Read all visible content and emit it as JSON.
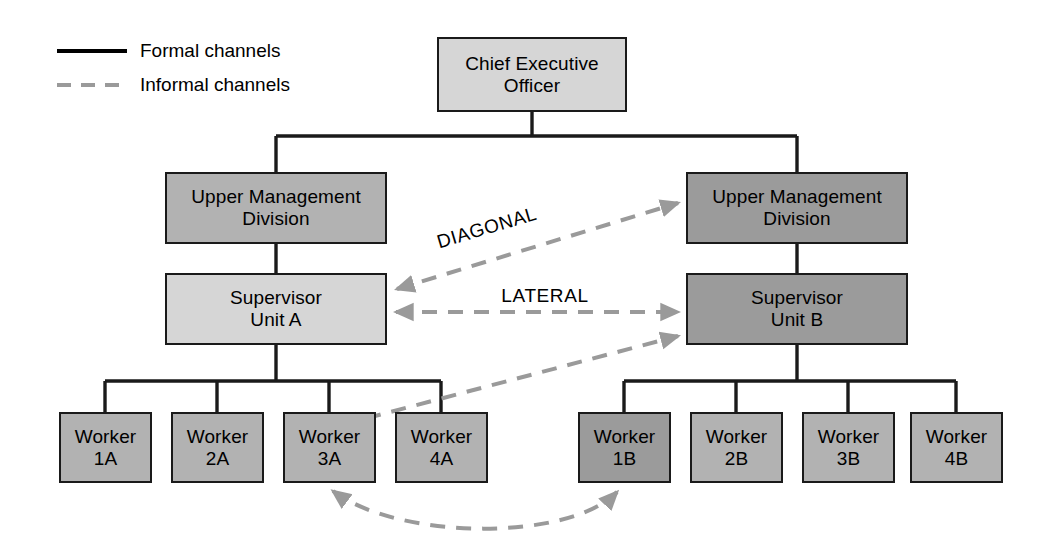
{
  "legend": {
    "formal": {
      "label": "Formal channels",
      "line_style": "solid",
      "color": "#000000"
    },
    "informal": {
      "label": "Informal channels",
      "line_style": "dashed",
      "color": "#9a9a9a"
    }
  },
  "flow_labels": {
    "diagonal": "DIAGONAL",
    "lateral": "LATERAL"
  },
  "chart_data": {
    "type": "diagram",
    "title": "",
    "nodes": [
      {
        "id": "ceo",
        "label": "Chief Executive\nOfficer",
        "tone": "light",
        "x": 437,
        "y": 37,
        "w": 190,
        "h": 75
      },
      {
        "id": "um_a",
        "label": "Upper Management\nDivision",
        "tone": "mid",
        "x": 165,
        "y": 172,
        "w": 222,
        "h": 72
      },
      {
        "id": "um_b",
        "label": "Upper Management\nDivision",
        "tone": "dark",
        "x": 686,
        "y": 172,
        "w": 222,
        "h": 72
      },
      {
        "id": "sup_a",
        "label": "Supervisor\nUnit A",
        "tone": "light",
        "x": 165,
        "y": 273,
        "w": 222,
        "h": 72
      },
      {
        "id": "sup_b",
        "label": "Supervisor\nUnit B",
        "tone": "dark",
        "x": 686,
        "y": 273,
        "w": 222,
        "h": 72
      },
      {
        "id": "w1a",
        "label": "Worker\n1A",
        "tone": "mid",
        "x": 59,
        "y": 412,
        "w": 93,
        "h": 71
      },
      {
        "id": "w2a",
        "label": "Worker\n2A",
        "tone": "mid",
        "x": 171,
        "y": 412,
        "w": 93,
        "h": 71
      },
      {
        "id": "w3a",
        "label": "Worker\n3A",
        "tone": "mid",
        "x": 283,
        "y": 412,
        "w": 93,
        "h": 71
      },
      {
        "id": "w4a",
        "label": "Worker\n4A",
        "tone": "mid",
        "x": 395,
        "y": 412,
        "w": 93,
        "h": 71
      },
      {
        "id": "w1b",
        "label": "Worker\n1B",
        "tone": "dark",
        "x": 578,
        "y": 412,
        "w": 93,
        "h": 71
      },
      {
        "id": "w2b",
        "label": "Worker\n2B",
        "tone": "mid",
        "x": 690,
        "y": 412,
        "w": 93,
        "h": 71
      },
      {
        "id": "w3b",
        "label": "Worker\n3B",
        "tone": "mid",
        "x": 802,
        "y": 412,
        "w": 93,
        "h": 71
      },
      {
        "id": "w4b",
        "label": "Worker\n4B",
        "tone": "mid",
        "x": 910,
        "y": 412,
        "w": 93,
        "h": 71
      }
    ],
    "formal_edges": [
      {
        "from": "ceo",
        "to": "um_a"
      },
      {
        "from": "ceo",
        "to": "um_b"
      },
      {
        "from": "um_a",
        "to": "sup_a"
      },
      {
        "from": "um_b",
        "to": "sup_b"
      },
      {
        "from": "sup_a",
        "to": "w1a"
      },
      {
        "from": "sup_a",
        "to": "w2a"
      },
      {
        "from": "sup_a",
        "to": "w3a"
      },
      {
        "from": "sup_a",
        "to": "w4a"
      },
      {
        "from": "sup_b",
        "to": "w1b"
      },
      {
        "from": "sup_b",
        "to": "w2b"
      },
      {
        "from": "sup_b",
        "to": "w3b"
      },
      {
        "from": "sup_b",
        "to": "w4b"
      }
    ],
    "informal_edges": [
      {
        "from": "sup_a",
        "to": "um_b",
        "kind": "diagonal",
        "label": "DIAGONAL",
        "arrows": "both"
      },
      {
        "from": "sup_a",
        "to": "sup_b",
        "kind": "lateral",
        "label": "LATERAL",
        "arrows": "both"
      },
      {
        "from": "w3a",
        "to": "sup_b",
        "kind": "diagonal",
        "label": "",
        "arrows": "both"
      },
      {
        "from": "w3a",
        "to": "w1b",
        "kind": "curved",
        "label": "",
        "arrows": "both"
      }
    ]
  }
}
